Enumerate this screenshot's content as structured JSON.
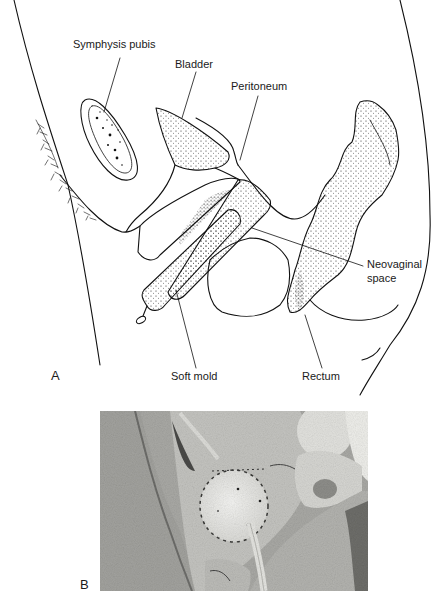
{
  "figure": {
    "panel_a": {
      "letter": "A",
      "labels": {
        "symphysis_pubis": "Symphysis pubis",
        "bladder": "Bladder",
        "peritoneum": "Peritoneum",
        "neovaginal_space_line1": "Neovaginal",
        "neovaginal_space_line2": "space",
        "soft_mold": "Soft mold",
        "rectum": "Rectum"
      }
    },
    "panel_b": {
      "letter": "B"
    }
  }
}
